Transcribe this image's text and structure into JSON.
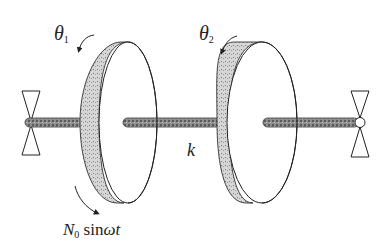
{
  "diagram": {
    "labels": {
      "theta1": {
        "symbol": "θ",
        "subscript": "1"
      },
      "theta2": {
        "symbol": "θ",
        "subscript": "2"
      },
      "stiffness": "k",
      "forcing": {
        "symbol": "N",
        "subscript": "0",
        "fn": "sin",
        "arg_omega": "ω",
        "arg_t": "t"
      }
    },
    "components": [
      {
        "id": "left-support",
        "type": "bearing"
      },
      {
        "id": "disk-1",
        "type": "disk",
        "angle_label": "θ1",
        "applied_torque": "N0 sin ωt"
      },
      {
        "id": "shaft-k",
        "type": "torsional-shaft",
        "stiffness": "k"
      },
      {
        "id": "disk-2",
        "type": "disk",
        "angle_label": "θ2"
      },
      {
        "id": "right-support",
        "type": "bearing"
      }
    ],
    "colors": {
      "line": "#222222",
      "shaft_fill": "#9a9a9a",
      "rim_fill": "#cfcfcf"
    }
  }
}
